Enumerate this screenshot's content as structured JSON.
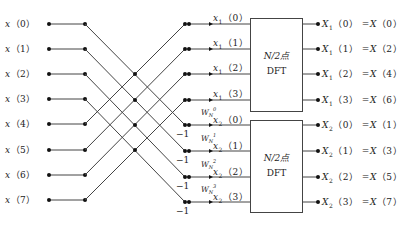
{
  "diagram": {
    "title": "",
    "type": "8-point DIT FFT first-stage butterfly decomposition",
    "inputs": [
      "x(0)",
      "x(1)",
      "x(2)",
      "x(3)",
      "x(4)",
      "x(5)",
      "x(6)",
      "x(7)"
    ],
    "intermediate_top": [
      "x1(0)",
      "x1(1)",
      "x1(2)",
      "x1(3)"
    ],
    "intermediate_bottom": [
      "x2(0)",
      "x2(1)",
      "x2(2)",
      "x2(3)"
    ],
    "twiddles": [
      "W_N^0",
      "W_N^1",
      "W_N^2",
      "W_N^3"
    ],
    "minus_one_label": "−1",
    "boxes": [
      {
        "line1": "N/2点",
        "line2": "DFT"
      },
      {
        "line1": "N/2点",
        "line2": "DFT"
      }
    ],
    "outputs_top": [
      "X1(0) =X(0)",
      "X1(1) =X(2)",
      "X1(2) =X(4)",
      "X1(3) =X(6)"
    ],
    "outputs_bottom": [
      "X2(0) =X(1)",
      "X2(1) =X(3)",
      "X2(2) =X(5)",
      "X2(3) =X(7)"
    ],
    "line_color": "#444444"
  }
}
